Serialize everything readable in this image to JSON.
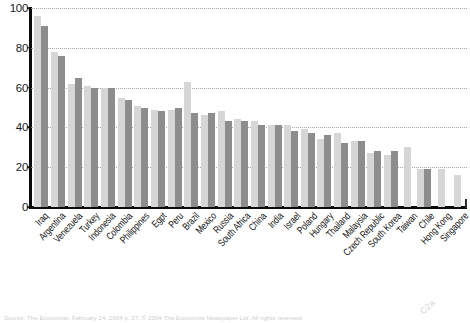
{
  "chart_data": {
    "type": "bar",
    "title": "",
    "subtitle": "",
    "xlabel": "",
    "ylabel": "",
    "ylim": [
      0,
      100
    ],
    "yticks": [
      0,
      20,
      40,
      60,
      80,
      100
    ],
    "grid": "horizontal-dotted",
    "legend": "none",
    "categories": [
      "Iraq",
      "Argentina",
      "Venezuela",
      "Turkey",
      "Indonesia",
      "Colombia",
      "Philippines",
      "Egpt",
      "Peru",
      "Brazil",
      "Mexico",
      "Russia",
      "South Africa",
      "China",
      "India",
      "Israel",
      "Poland",
      "Hungary",
      "Thailand",
      "Malaysia",
      "Czech Republic",
      "South Korea",
      "Taiwan",
      "Chile",
      "Hong Kong",
      "Singapore"
    ],
    "series": [
      {
        "name": "series-1",
        "color": "#d6d6d6",
        "values": [
          96,
          78,
          62,
          61,
          60,
          55,
          51,
          49,
          49,
          63,
          46,
          48,
          44,
          43,
          41,
          41,
          39,
          34,
          37,
          33,
          27,
          26,
          30,
          19,
          19,
          16
        ]
      },
      {
        "name": "series-2",
        "color": "#8d8d8d",
        "values": [
          91,
          76,
          65,
          60,
          60,
          54,
          50,
          48,
          50,
          47,
          47,
          43,
          43,
          41,
          41,
          38,
          37,
          36,
          32,
          33,
          28,
          28,
          0,
          19,
          0,
          0
        ]
      }
    ]
  },
  "axes": {
    "y_tick_labels": [
      "100",
      "80",
      "60",
      "40",
      "20",
      "0"
    ],
    "y_max": 100,
    "y_min": 0
  },
  "footer": {
    "source": "Source: The Economist, February 14, 2004       p. 27.  © 2004 The Economist Newspaper Ltd.  All rights reserved.",
    "margin_mark": "C2a"
  },
  "style": {
    "bar_color_light": "#d6d6d6",
    "bar_color_dark": "#8d8d8d",
    "axis_color": "#0a0a0a",
    "grid_color": "#9a9a9a",
    "background": "#ffffff"
  }
}
